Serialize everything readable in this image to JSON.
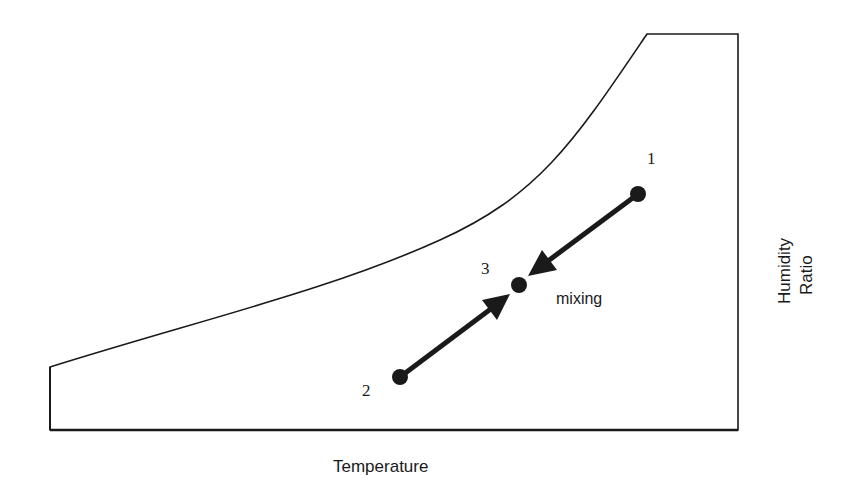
{
  "diagram": {
    "type": "psychrometric-chart-schematic",
    "x_axis_label": "Temperature",
    "y_axis_label_line1": "Humidity",
    "y_axis_label_line2": "Ratio",
    "process_label": "mixing",
    "points": [
      {
        "id": "1",
        "label": "1",
        "x": 638,
        "y": 194
      },
      {
        "id": "2",
        "label": "2",
        "x": 400,
        "y": 377
      },
      {
        "id": "3",
        "label": "3",
        "x": 519,
        "y": 285
      }
    ],
    "arrows": [
      {
        "from": "1",
        "to": "3"
      },
      {
        "from": "2",
        "to": "3"
      }
    ],
    "colors": {
      "line": "#1a1a1a",
      "background": "#ffffff"
    }
  }
}
